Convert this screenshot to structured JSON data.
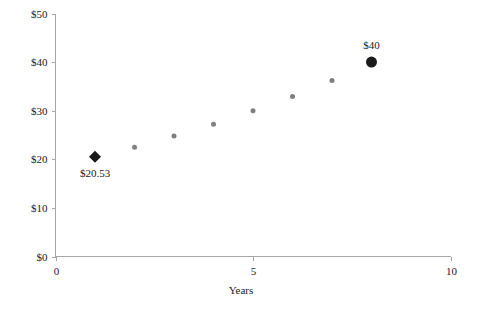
{
  "chart_data": {
    "type": "scatter",
    "title": "",
    "subtitle": "",
    "xlabel": "Years",
    "ylabel": "",
    "xlim": [
      0,
      10
    ],
    "ylim": [
      0,
      50
    ],
    "grid": false,
    "legend": "none",
    "x_ticks": [
      "0",
      "5",
      "10"
    ],
    "x_tick_values": [
      0,
      5,
      10
    ],
    "y_ticks": [
      "$0",
      "$10",
      "$20",
      "$30",
      "$40",
      "$50"
    ],
    "y_tick_values": [
      0,
      10,
      20,
      30,
      40,
      50
    ],
    "x": [
      1,
      2,
      3,
      4,
      5,
      6,
      7,
      8
    ],
    "values": [
      20.53,
      22.5,
      24.8,
      27.2,
      30.0,
      32.9,
      36.2,
      40.0
    ],
    "series": [
      {
        "name": "growth-points",
        "x": [
          1,
          2,
          3,
          4,
          5,
          6,
          7,
          8
        ],
        "values": [
          20.53,
          22.5,
          24.8,
          27.2,
          30.0,
          32.9,
          36.2,
          40.0
        ],
        "markers": [
          {
            "x": 1,
            "y": 20.53,
            "shape": "diamond",
            "color": "#1a1a1a",
            "size": 9,
            "label": "$20.53",
            "label_position": "below"
          },
          {
            "x": 2,
            "y": 22.5,
            "shape": "circle",
            "color": "#7f7f7f",
            "size": 5,
            "label": "",
            "label_position": ""
          },
          {
            "x": 3,
            "y": 24.8,
            "shape": "circle",
            "color": "#7f7f7f",
            "size": 5,
            "label": "",
            "label_position": ""
          },
          {
            "x": 4,
            "y": 27.2,
            "shape": "circle",
            "color": "#7f7f7f",
            "size": 5,
            "label": "",
            "label_position": ""
          },
          {
            "x": 5,
            "y": 30.0,
            "shape": "circle",
            "color": "#7f7f7f",
            "size": 5,
            "label": "",
            "label_position": ""
          },
          {
            "x": 6,
            "y": 32.9,
            "shape": "circle",
            "color": "#7f7f7f",
            "size": 5,
            "label": "",
            "label_position": ""
          },
          {
            "x": 7,
            "y": 36.2,
            "shape": "circle",
            "color": "#7f7f7f",
            "size": 5,
            "label": "",
            "label_position": ""
          },
          {
            "x": 8,
            "y": 40.0,
            "shape": "circle",
            "color": "#1a1a1a",
            "size": 11,
            "label": "$40",
            "label_position": "above"
          }
        ]
      }
    ],
    "annotations": [
      {
        "text": "$20.53",
        "x": 1,
        "y": 20.53
      },
      {
        "text": "$40",
        "x": 8,
        "y": 40.0
      }
    ],
    "colors": {
      "axis": "#a6a6a6",
      "text": "#1a1a1a",
      "marker_gray": "#7f7f7f",
      "marker_black": "#1a1a1a",
      "background": "#ffffff"
    }
  }
}
